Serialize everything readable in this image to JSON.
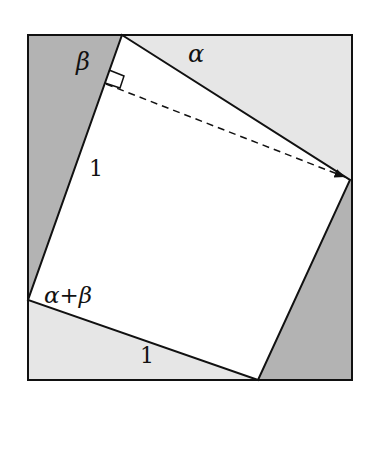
{
  "diagram": {
    "type": "geometric-proof",
    "colors": {
      "background": "#ffffff",
      "dark_shade": "#b3b3b3",
      "light_shade": "#e6e6e6",
      "square_fill": "#ffffff",
      "stroke": "#111111"
    },
    "outer_rect": {
      "x1": 28,
      "y1": 35,
      "x2": 352,
      "y2": 380
    },
    "square": {
      "top": [
        122,
        35
      ],
      "right": [
        350,
        180
      ],
      "bottom": [
        258,
        380
      ],
      "left": [
        28,
        300
      ]
    },
    "right_angle_mark": "at top-left side near top vertex",
    "dashed_arrow": {
      "from": [
        107,
        85
      ],
      "to": [
        348,
        178
      ]
    },
    "labels": {
      "beta": "β",
      "alpha": "α",
      "side_left": "1",
      "angle_sum": "α+β",
      "side_bottom": "1"
    }
  }
}
